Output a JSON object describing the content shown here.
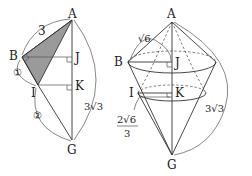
{
  "figure_left": {
    "points": {
      "A": "A",
      "B": "B",
      "J": "J",
      "I": "I",
      "K": "K",
      "G": "G"
    },
    "labels": {
      "AB": "3",
      "BI": "①",
      "IG": "②",
      "AG": "3√3"
    },
    "shaded_region": "triangle ABI",
    "fill_color": "#9a9a9a"
  },
  "figure_right": {
    "points": {
      "A": "A",
      "B": "B",
      "J": "J",
      "I": "I",
      "K": "K",
      "G": "G"
    },
    "labels": {
      "AB": "√6",
      "IK_num": "2√6",
      "IK_den": "3",
      "AG": "3√3"
    },
    "description": "solid of revolution: cone AB-J joined to cone BG with cross-section circle at I-K"
  }
}
